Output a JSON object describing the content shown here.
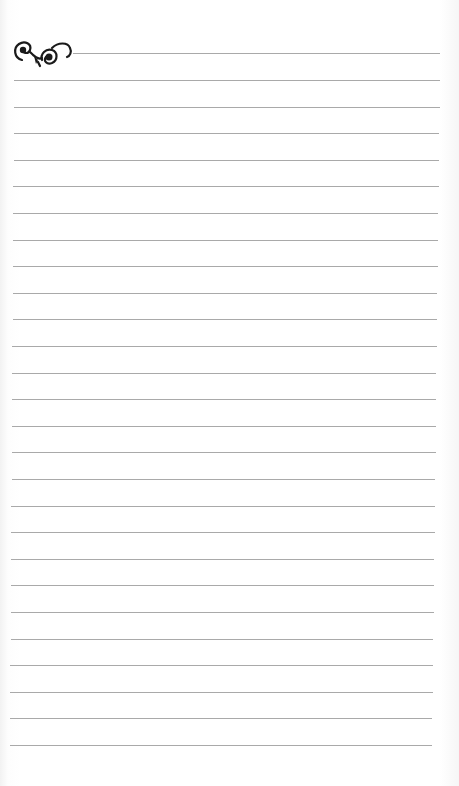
{
  "page": {
    "type": "lined-notepaper",
    "line_color": "#9a9a9a",
    "ornament_color": "#1a1a1a",
    "ornament": "flourish-swirl-ornament",
    "header_line": {
      "y": 53,
      "x_start": 73,
      "x_end": 440
    },
    "ruled_lines": {
      "count": 26,
      "first_y": 80,
      "spacing": 26.6,
      "x_start_top": 14,
      "x_start_bottom": 10,
      "x_end_top": 440,
      "x_end_bottom": 432
    }
  }
}
